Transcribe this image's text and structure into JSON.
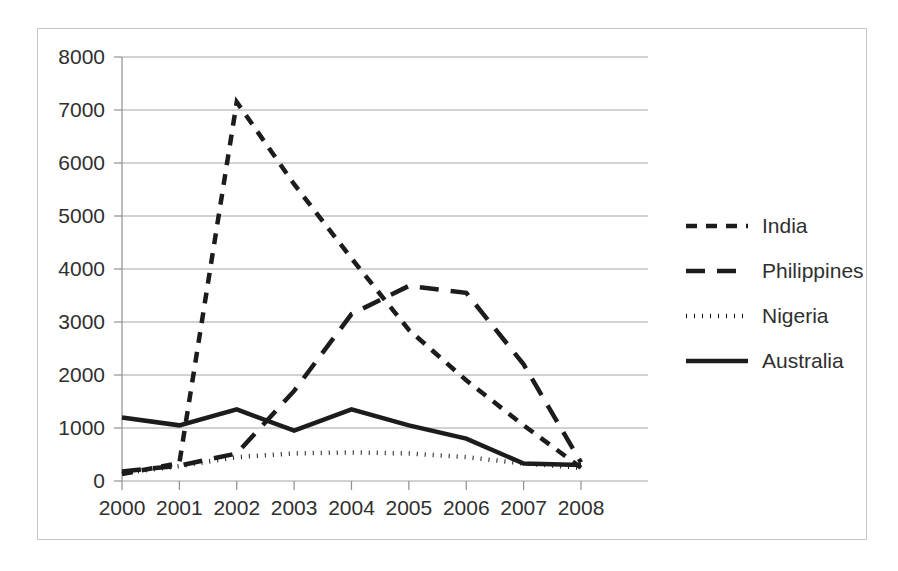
{
  "figure": {
    "border_color": "#c9c9c9",
    "background": "#ffffff"
  },
  "chart_data": {
    "type": "line",
    "title": "",
    "subtitle": "",
    "xlabel": "",
    "ylabel": "",
    "x": [
      2000,
      2001,
      2002,
      2003,
      2004,
      2005,
      2006,
      2007,
      2008
    ],
    "categories": [
      "2000",
      "2001",
      "2002",
      "2003",
      "2004",
      "2005",
      "2006",
      "2007",
      "2008"
    ],
    "xlim": [
      2000,
      2008
    ],
    "ylim": [
      0,
      8000
    ],
    "y_ticks": [
      0,
      1000,
      2000,
      3000,
      4000,
      5000,
      6000,
      7000,
      8000
    ],
    "y_tick_labels": [
      "0",
      "1000",
      "2000",
      "3000",
      "4000",
      "5000",
      "6000",
      "7000",
      "8000"
    ],
    "x_tick_labels": [
      "2000",
      "2001",
      "2002",
      "2003",
      "2004",
      "2005",
      "2006",
      "2007",
      "2008"
    ],
    "grid": "horizontal",
    "legend_position": "right",
    "line_color": "#1c1c1c",
    "series": [
      {
        "name": "India",
        "style": "dashed-short",
        "dasharray": "11,9",
        "width": 4.5,
        "values": [
          130,
          340,
          7150,
          5600,
          4200,
          2850,
          1900,
          1050,
          250
        ]
      },
      {
        "name": "Philippines",
        "style": "dashed-long",
        "dasharray": "19,12",
        "width": 4.5,
        "values": [
          180,
          290,
          520,
          1700,
          3150,
          3680,
          3550,
          2200,
          350
        ]
      },
      {
        "name": "Nigeria",
        "style": "dotted",
        "dasharray": "1,7",
        "width": 4.5,
        "values": [
          150,
          280,
          450,
          520,
          540,
          520,
          450,
          330,
          250
        ]
      },
      {
        "name": "Australia",
        "style": "solid",
        "dasharray": "none",
        "width": 4.5,
        "values": [
          1200,
          1050,
          1350,
          950,
          1350,
          1050,
          800,
          330,
          300
        ]
      }
    ]
  },
  "legend": {
    "entries": [
      {
        "label": "India",
        "dasharray": "11,9"
      },
      {
        "label": "Philippines",
        "dasharray": "19,12"
      },
      {
        "label": "Nigeria",
        "dasharray": "1,7"
      },
      {
        "label": "Australia",
        "dasharray": "none"
      }
    ]
  }
}
